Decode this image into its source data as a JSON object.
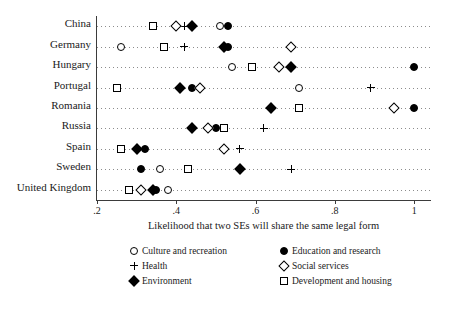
{
  "chart_data": {
    "type": "scatter",
    "title": "",
    "xlabel": "Likelihood that two SEs will share the same legal form",
    "ylabel": "",
    "xlim": [
      0.2,
      1.04
    ],
    "xticks": [
      0.2,
      0.4,
      0.6,
      0.8,
      1.0
    ],
    "xticklabels": [
      ".2",
      ".4",
      ".6",
      ".8",
      "1"
    ],
    "grid": "horizontal-dotted",
    "legend_position": "below-axis",
    "categories": [
      "China",
      "Germany",
      "Hungary",
      "Portugal",
      "Romania",
      "Russia",
      "Spain",
      "Sweden",
      "United Kingdom"
    ],
    "series": [
      {
        "name": "Culture and recreation",
        "marker": "circle-open",
        "values": [
          0.51,
          0.26,
          0.54,
          0.71,
          null,
          null,
          null,
          0.36,
          0.38
        ]
      },
      {
        "name": "Education and research",
        "marker": "circle-filled",
        "values": [
          0.53,
          0.53,
          1.0,
          0.44,
          1.0,
          0.5,
          0.32,
          0.31,
          0.35
        ]
      },
      {
        "name": "Health",
        "marker": "plus",
        "values": [
          0.42,
          0.42,
          null,
          0.89,
          null,
          0.62,
          0.56,
          0.69,
          null
        ]
      },
      {
        "name": "Social services",
        "marker": "diamond-open",
        "values": [
          0.4,
          0.69,
          0.66,
          0.46,
          0.95,
          0.48,
          0.52,
          null,
          0.31
        ]
      },
      {
        "name": "Environment",
        "marker": "diamond-filled",
        "values": [
          0.44,
          0.52,
          0.69,
          0.41,
          0.64,
          0.44,
          0.3,
          0.56,
          0.34
        ]
      },
      {
        "name": "Development and housing",
        "marker": "square-open",
        "values": [
          0.34,
          0.37,
          0.59,
          0.25,
          0.71,
          0.52,
          0.26,
          0.43,
          0.28
        ]
      }
    ]
  },
  "legend": {
    "items": [
      {
        "label": "Culture and recreation",
        "marker": "circle-open"
      },
      {
        "label": "Education and research",
        "marker": "circle-filled"
      },
      {
        "label": "Health",
        "marker": "plus"
      },
      {
        "label": "Social services",
        "marker": "diamond-open"
      },
      {
        "label": "Environment",
        "marker": "diamond-filled"
      },
      {
        "label": "Development and housing",
        "marker": "square-open"
      }
    ]
  },
  "colors": {
    "marker": "#000000",
    "axis": "#3b3b3b",
    "grid": "#8c8c8c",
    "background": "#ffffff"
  }
}
